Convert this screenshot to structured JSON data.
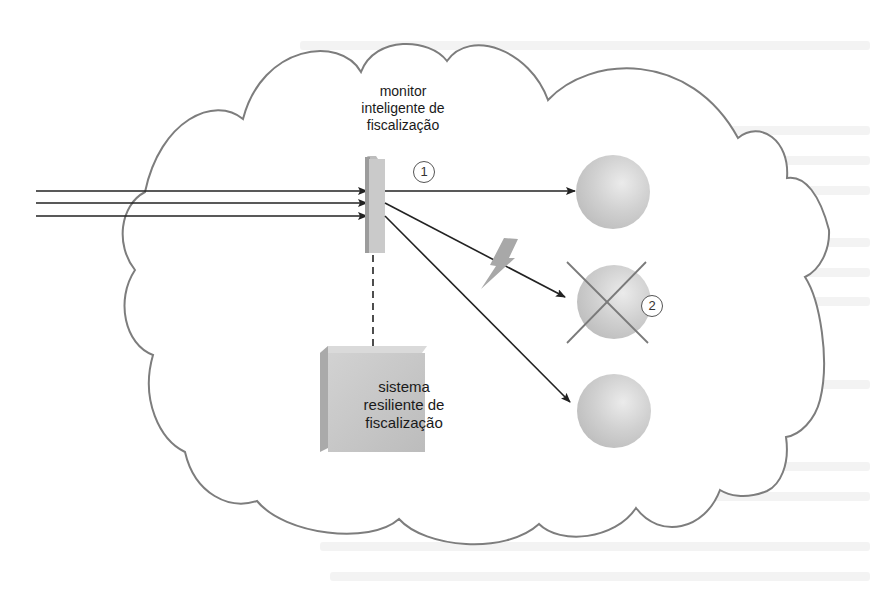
{
  "diagram": {
    "monitor": {
      "label_lines": [
        "monitor",
        "inteligente de",
        "fiscalização"
      ],
      "badge": "1"
    },
    "resilient_system": {
      "label_lines": [
        "sistema",
        "resiliente de",
        "fiscalização"
      ]
    },
    "failed_node": {
      "badge": "2"
    },
    "incoming_arrows_count": 3,
    "target_nodes_count": 3,
    "colors": {
      "cloud_stroke": "#7a7a7a",
      "arrow": "#222222",
      "sphere": "#cfcfcf",
      "box": "#c8c8c8",
      "lightning": "#a9a9a9"
    }
  }
}
